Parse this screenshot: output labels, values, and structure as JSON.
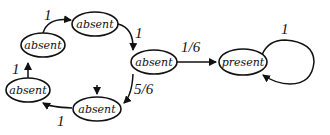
{
  "diagram": {
    "type": "state-transition",
    "nodes": [
      {
        "id": "n1",
        "label": "absent"
      },
      {
        "id": "n2",
        "label": "absent"
      },
      {
        "id": "n3",
        "label": "absent"
      },
      {
        "id": "n4",
        "label": "absent"
      },
      {
        "id": "n5",
        "label": "absent"
      },
      {
        "id": "n6",
        "label": "present"
      }
    ],
    "edges": [
      {
        "from": "n1",
        "to": "n2",
        "label": "1"
      },
      {
        "from": "n2",
        "to": "n3",
        "label": "1"
      },
      {
        "from": "n3",
        "to": "n6",
        "label": "1/6"
      },
      {
        "from": "n3",
        "to": "n4",
        "label": "5/6"
      },
      {
        "from": "n4",
        "to": "n5",
        "label": "1"
      },
      {
        "from": "n5",
        "to": "n1",
        "label": "1"
      },
      {
        "from": "n6",
        "to": "n6",
        "label": "1"
      }
    ],
    "start_node": "n4"
  }
}
